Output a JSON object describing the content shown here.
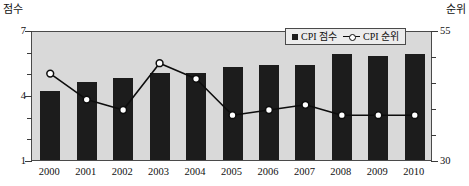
{
  "chart_data": {
    "type": "bar",
    "title": "",
    "subtitle": "",
    "xlabel": "",
    "ylabel": "점수",
    "y2label": "순위",
    "categories": [
      "2000",
      "2001",
      "2002",
      "2003",
      "2004",
      "2005",
      "2006",
      "2007",
      "2008",
      "2009",
      "2010"
    ],
    "ylim": [
      1,
      7
    ],
    "yticks": [
      1,
      4,
      7
    ],
    "ytick_labels": [
      "1",
      "4",
      "7"
    ],
    "y2lim": [
      30,
      55
    ],
    "y2ticks": [
      30,
      55
    ],
    "y2tick_labels": [
      "30",
      "55"
    ],
    "grid": false,
    "legend_position": "top-right",
    "series": [
      {
        "name": "CPI 점수",
        "type": "bar",
        "axis": "left",
        "color": "#1c1c1c",
        "values": [
          4.2,
          4.6,
          4.8,
          5.0,
          5.0,
          5.3,
          5.4,
          5.4,
          5.9,
          5.8,
          5.9
        ]
      },
      {
        "name": "CPI 순위",
        "type": "line",
        "axis": "right",
        "color": "#0d0d0d",
        "marker": "circle-open",
        "values": [
          47,
          42,
          40,
          49,
          46,
          39,
          40,
          41,
          39,
          39,
          39
        ]
      }
    ]
  },
  "axes": {
    "left_caption": "점수",
    "right_caption": "순위"
  },
  "legend": {
    "items": [
      {
        "label": "CPI 점수",
        "marker": "filled-square"
      },
      {
        "label": "CPI 순위",
        "marker": "line-circle"
      }
    ]
  },
  "colors": {
    "plot_background": "#d9d9d9",
    "bar": "#1c1c1c",
    "line": "#0d0d0d",
    "marker_fill": "#ffffff",
    "frame": "#4a4a4a",
    "text": "#111111",
    "legend_background": "#ececec"
  }
}
